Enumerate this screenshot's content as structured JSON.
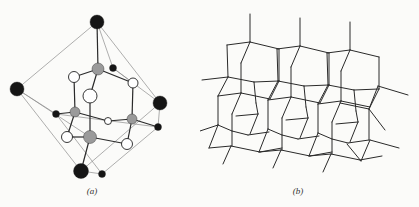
{
  "figure_a": {
    "caption": "(a)",
    "caption_pos": [
      92,
      186
    ],
    "colors": {
      "black": "#151515",
      "gray": "#9a9a9a",
      "white": "#ffffff",
      "bond": "#2a2a2a",
      "frame": "#8c8c8c"
    },
    "atoms": [
      {
        "id": "T",
        "type": "black",
        "x": 97,
        "y": 22,
        "r": 7
      },
      {
        "id": "L",
        "type": "black",
        "x": 17,
        "y": 89,
        "r": 7
      },
      {
        "id": "R",
        "type": "black",
        "x": 160,
        "y": 103,
        "r": 7
      },
      {
        "id": "B",
        "type": "black",
        "x": 81,
        "y": 171,
        "r": 7.5
      },
      {
        "id": "s1",
        "type": "black",
        "x": 113,
        "y": 68,
        "r": 3.5
      },
      {
        "id": "s2",
        "type": "black",
        "x": 56,
        "y": 114,
        "r": 3.5
      },
      {
        "id": "s3",
        "type": "black",
        "x": 158,
        "y": 127,
        "r": 3.5
      },
      {
        "id": "s4",
        "type": "black",
        "x": 102,
        "y": 174,
        "r": 3.5
      },
      {
        "id": "g1",
        "type": "gray",
        "x": 98,
        "y": 69,
        "r": 6
      },
      {
        "id": "g2",
        "type": "gray",
        "x": 75,
        "y": 112,
        "r": 5
      },
      {
        "id": "g3",
        "type": "gray",
        "x": 132,
        "y": 119,
        "r": 5
      },
      {
        "id": "g4",
        "type": "gray",
        "x": 90,
        "y": 137,
        "r": 6.5
      },
      {
        "id": "w1",
        "type": "white",
        "x": 74,
        "y": 77,
        "r": 5.5
      },
      {
        "id": "w2",
        "type": "white",
        "x": 133,
        "y": 83,
        "r": 5
      },
      {
        "id": "w3",
        "type": "white",
        "x": 90,
        "y": 96,
        "r": 7
      },
      {
        "id": "w4",
        "type": "white",
        "x": 108,
        "y": 121,
        "r": 3.5
      },
      {
        "id": "w5",
        "type": "white",
        "x": 67,
        "y": 137,
        "r": 5.5
      },
      {
        "id": "w6",
        "type": "white",
        "x": 127,
        "y": 144,
        "r": 5.5
      }
    ],
    "frame_edges": [
      [
        "T",
        "L"
      ],
      [
        "T",
        "s1"
      ],
      [
        "T",
        "R"
      ],
      [
        "L",
        "s2"
      ],
      [
        "L",
        "B"
      ],
      [
        "R",
        "s3"
      ],
      [
        "R",
        "B"
      ],
      [
        "s1",
        "w2"
      ],
      [
        "s2",
        "s3"
      ],
      [
        "s2",
        "s4"
      ],
      [
        "s3",
        "s4"
      ],
      [
        "B",
        "s4"
      ],
      [
        "L",
        "g4"
      ],
      [
        "s1",
        "R"
      ]
    ],
    "bonds": [
      [
        "T",
        "g1"
      ],
      [
        "g1",
        "w1"
      ],
      [
        "g1",
        "w2"
      ],
      [
        "g1",
        "w3"
      ],
      [
        "w1",
        "g2"
      ],
      [
        "w3",
        "g4"
      ],
      [
        "w2",
        "g3"
      ],
      [
        "g2",
        "w5"
      ],
      [
        "g2",
        "w4"
      ],
      [
        "w4",
        "g3"
      ],
      [
        "g2",
        "s2"
      ],
      [
        "g4",
        "w5"
      ],
      [
        "g4",
        "w6"
      ],
      [
        "g3",
        "w6"
      ],
      [
        "g3",
        "s3"
      ],
      [
        "g4",
        "B"
      ]
    ]
  },
  "figure_b": {
    "caption": "(b)",
    "caption_pos": [
      98,
      186
    ],
    "line_color": "#2a2a2a",
    "cell_offset": [
      50,
      4
    ],
    "cell_count": 3,
    "cell_segments": [
      [
        50,
        14,
        50,
        42
      ],
      [
        27,
        45,
        50,
        42
      ],
      [
        50,
        42,
        79,
        49
      ],
      [
        27,
        45,
        28,
        77
      ],
      [
        50,
        42,
        41,
        63
      ],
      [
        41,
        63,
        41,
        93
      ],
      [
        79,
        49,
        79,
        81
      ],
      [
        28,
        77,
        54,
        82
      ],
      [
        54,
        82,
        79,
        81
      ],
      [
        28,
        77,
        18,
        96
      ],
      [
        18,
        96,
        41,
        93
      ],
      [
        41,
        93,
        70,
        99
      ],
      [
        54,
        82,
        56,
        103
      ],
      [
        79,
        81,
        70,
        99
      ],
      [
        18,
        96,
        18,
        125
      ],
      [
        41,
        93,
        32,
        114
      ],
      [
        32,
        114,
        32,
        146
      ],
      [
        36,
        116,
        58,
        114
      ],
      [
        56,
        103,
        58,
        114
      ],
      [
        58,
        114,
        50,
        134
      ],
      [
        32,
        131,
        48,
        135
      ],
      [
        48,
        135,
        69,
        132
      ],
      [
        18,
        125,
        9,
        148
      ],
      [
        9,
        148,
        31,
        146
      ],
      [
        31,
        146,
        60,
        152
      ],
      [
        60,
        152,
        82,
        148
      ],
      [
        31,
        146,
        23,
        164
      ],
      [
        18,
        125,
        32,
        131
      ]
    ],
    "extra_segments": [
      [
        2,
        80,
        28,
        77
      ],
      [
        0,
        131,
        18,
        125
      ],
      [
        178,
        86,
        208,
        95
      ],
      [
        169,
        109,
        185,
        130
      ],
      [
        170,
        140,
        199,
        148
      ],
      [
        170,
        140,
        161,
        161
      ],
      [
        147,
        144,
        161,
        161
      ],
      [
        178,
        86,
        169,
        109
      ],
      [
        169,
        109,
        169,
        140
      ],
      [
        140,
        103,
        169,
        109
      ]
    ]
  }
}
